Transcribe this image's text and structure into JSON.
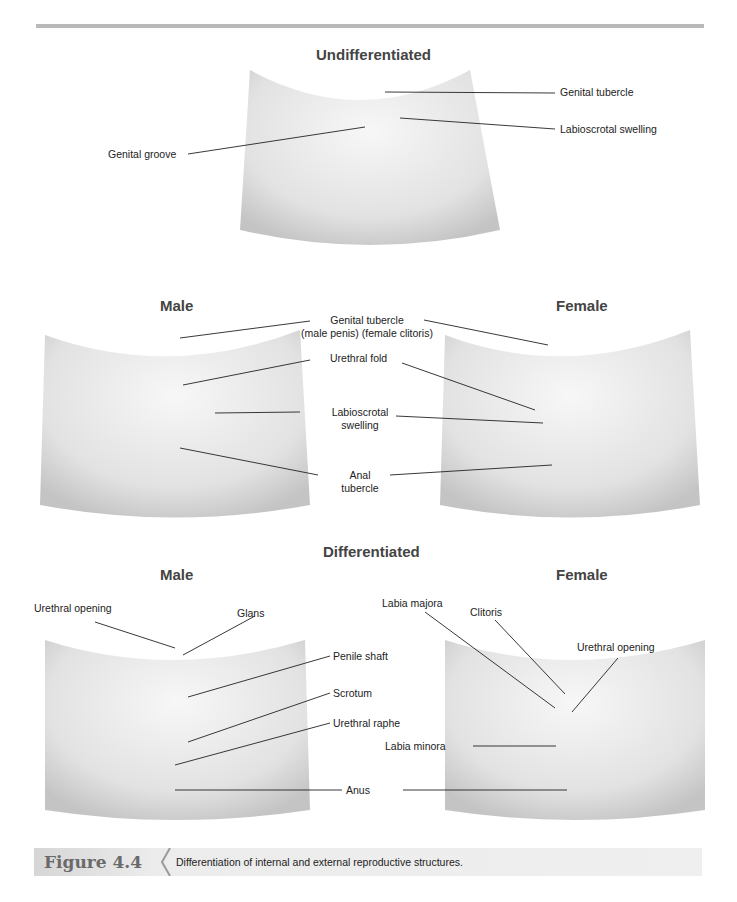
{
  "figure": {
    "number": "Figure 4.4",
    "caption": "Differentiation of internal and external reproductive structures."
  },
  "sections": {
    "undifferentiated": {
      "title": "Undifferentiated",
      "labels": {
        "genital_tubercle": "Genital tubercle",
        "labioscrotal_swelling": "Labioscrotal swelling",
        "genital_groove": "Genital groove"
      }
    },
    "intermediate": {
      "male_title": "Male",
      "female_title": "Female",
      "labels": {
        "genital_tubercle": "Genital tubercle",
        "genital_tubercle_sub": "(male penis)   (female clitoris)",
        "urethral_fold": "Urethral fold",
        "labioscrotal_1": "Labioscrotal",
        "labioscrotal_2": "swelling",
        "anal_1": "Anal",
        "anal_2": "tubercle"
      }
    },
    "differentiated": {
      "title": "Differentiated",
      "male_title": "Male",
      "female_title": "Female",
      "male_labels": {
        "urethral_opening": "Urethral opening",
        "glans": "Glans",
        "penile_shaft": "Penile shaft",
        "scrotum": "Scrotum",
        "urethral_raphe": "Urethral raphe"
      },
      "female_labels": {
        "labia_majora": "Labia majora",
        "clitoris": "Clitoris",
        "urethral_opening": "Urethral opening",
        "labia_minora": "Labia minora"
      },
      "shared_labels": {
        "anus": "Anus"
      }
    }
  },
  "colors": {
    "rule": "#b9b9b9",
    "skin_light": "#f3f3f3",
    "skin_shade": "#c9c9c9",
    "caption_bar": "#ececec",
    "figure_number": "#6a6a6a"
  }
}
